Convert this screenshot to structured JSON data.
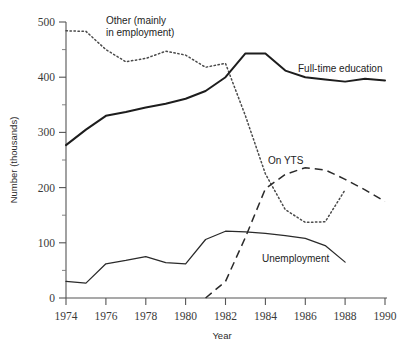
{
  "chart_data": {
    "type": "line",
    "title": "",
    "xlabel": "Year",
    "ylabel": "Number (thousands)",
    "xlim": [
      1974,
      1990
    ],
    "ylim": [
      0,
      500
    ],
    "xticks": [
      1974,
      1976,
      1978,
      1980,
      1982,
      1984,
      1986,
      1988,
      1990
    ],
    "xtick_labels": [
      "1974",
      "1976",
      "1978",
      "1980",
      "1982",
      "1984",
      "1986",
      "1988",
      "1990"
    ],
    "yticks": [
      0,
      100,
      200,
      300,
      400,
      500
    ],
    "ytick_labels": [
      "0",
      "100",
      "200",
      "300",
      "400",
      "500"
    ],
    "yticks_minor": [
      50,
      150,
      250,
      350,
      450
    ],
    "grid": false,
    "legend_position": "inline-annotations",
    "series": [
      {
        "name": "Full-time education",
        "style": "solid-thick",
        "label": "Full-time education",
        "x": [
          1974,
          1975,
          1976,
          1977,
          1978,
          1979,
          1980,
          1981,
          1982,
          1983,
          1984,
          1985,
          1986,
          1987,
          1988,
          1989,
          1990
        ],
        "values": [
          277,
          305,
          330,
          337,
          345,
          352,
          361,
          375,
          400,
          443,
          443,
          412,
          400,
          396,
          392,
          397,
          394
        ]
      },
      {
        "name": "Other (mainly in employment)",
        "style": "dotted",
        "label": "Other (mainly\nin employment)",
        "label_line1": "Other (mainly",
        "label_line2": "in employment)",
        "x": [
          1974,
          1975,
          1976,
          1977,
          1978,
          1979,
          1980,
          1981,
          1982,
          1983,
          1984,
          1985,
          1986,
          1987,
          1988
        ],
        "values": [
          484,
          483,
          450,
          428,
          434,
          447,
          440,
          418,
          425,
          330,
          225,
          160,
          137,
          138,
          196
        ]
      },
      {
        "name": "On YTS",
        "style": "dashed",
        "label": "On YTS",
        "x": [
          1981,
          1982,
          1983,
          1984,
          1985,
          1986,
          1987,
          1988,
          1989,
          1990
        ],
        "values": [
          0,
          30,
          110,
          198,
          224,
          236,
          232,
          215,
          196,
          175
        ]
      },
      {
        "name": "Unemployment",
        "style": "solid-thin",
        "label": "Unemployment",
        "x": [
          1974,
          1975,
          1976,
          1977,
          1978,
          1979,
          1980,
          1981,
          1982,
          1983,
          1984,
          1985,
          1986,
          1987,
          1988
        ],
        "values": [
          30,
          27,
          62,
          68,
          75,
          64,
          62,
          106,
          121,
          120,
          117,
          113,
          108,
          95,
          65
        ]
      }
    ],
    "annotations": [
      {
        "text": "Other (mainly",
        "x_px": 106,
        "y_px": 24
      },
      {
        "text": "in employment)",
        "x_px": 106,
        "y_px": 36
      },
      {
        "text": "Full-time education",
        "x_px": 298,
        "y_px": 72
      },
      {
        "text": "On YTS",
        "x_px": 268,
        "y_px": 164
      },
      {
        "text": "Unemployment",
        "x_px": 262,
        "y_px": 262
      }
    ]
  },
  "axes": {
    "y_title": "Number (thousands)",
    "x_title": "Year"
  }
}
